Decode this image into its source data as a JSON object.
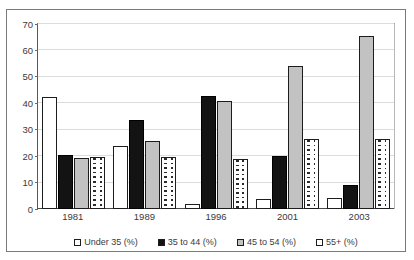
{
  "chart_data": {
    "type": "bar",
    "title": "",
    "subtitle": "",
    "xlabel": "",
    "ylabel": "",
    "categories": [
      "1981",
      "1989",
      "1996",
      "2001",
      "2003"
    ],
    "ylim": [
      0,
      70
    ],
    "yticks": [
      0,
      10,
      20,
      30,
      40,
      50,
      60,
      70
    ],
    "ytick_labels": [
      "0",
      "10",
      "20",
      "30",
      "40",
      "50",
      "60",
      "70"
    ],
    "grid": true,
    "legend_position": "bottom",
    "series": [
      {
        "name": "Under 35 (%)",
        "fill": "white",
        "color": "#ffffff",
        "values": [
          42,
          23.3,
          1.4,
          3.6,
          3.7
        ]
      },
      {
        "name": "35 to 44 (%)",
        "fill": "solid-black",
        "color": "#131313",
        "values": [
          20.2,
          33.2,
          42.2,
          19.5,
          8.8
        ]
      },
      {
        "name": "45 to 54 (%)",
        "fill": "light-gray",
        "color": "#c2c2c2",
        "values": [
          19,
          25.3,
          40.4,
          53.7,
          64.9
        ]
      },
      {
        "name": "55+ (%)",
        "fill": "dotted-vertical",
        "color": "#ffffff",
        "values": [
          19.4,
          19.4,
          18.7,
          26,
          26.1
        ]
      }
    ]
  },
  "legend": {
    "items": [
      {
        "label": "Under 35 (%)"
      },
      {
        "label": "35 to 44 (%)"
      },
      {
        "label": "45 to 54 (%)"
      },
      {
        "label": "55+ (%)"
      }
    ]
  }
}
